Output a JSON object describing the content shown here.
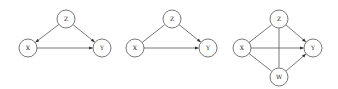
{
  "colors": {
    "stroke": "#555555",
    "fill": "#ffffff",
    "text": "#222222"
  },
  "node_radius": 9,
  "diagrams": [
    {
      "id": "diagram-1",
      "nodes": [
        {
          "id": "Z",
          "label": "Z",
          "x": 66,
          "y": 19
        },
        {
          "id": "X",
          "label": "X",
          "x": 28,
          "y": 48
        },
        {
          "id": "Y",
          "label": "Y",
          "x": 102,
          "y": 48
        }
      ],
      "edges": [
        {
          "from": "Z",
          "to": "X",
          "directed": true
        },
        {
          "from": "Z",
          "to": "Y",
          "directed": true
        },
        {
          "from": "X",
          "to": "Y",
          "directed": true
        }
      ]
    },
    {
      "id": "diagram-2",
      "nodes": [
        {
          "id": "Z",
          "label": "Z",
          "x": 172,
          "y": 19
        },
        {
          "id": "X",
          "label": "X",
          "x": 135,
          "y": 48
        },
        {
          "id": "Y",
          "label": "Y",
          "x": 208,
          "y": 48
        }
      ],
      "edges": [
        {
          "from": "X",
          "to": "Z",
          "directed": false
        },
        {
          "from": "Z",
          "to": "Y",
          "directed": true
        },
        {
          "from": "X",
          "to": "Y",
          "directed": true
        }
      ]
    },
    {
      "id": "diagram-3",
      "nodes": [
        {
          "id": "Z",
          "label": "Z",
          "x": 279,
          "y": 19
        },
        {
          "id": "X",
          "label": "X",
          "x": 242,
          "y": 48
        },
        {
          "id": "Y",
          "label": "Y",
          "x": 313,
          "y": 48
        },
        {
          "id": "W",
          "label": "W",
          "x": 279,
          "y": 77
        }
      ],
      "edges": [
        {
          "from": "X",
          "to": "Z",
          "directed": false
        },
        {
          "from": "X",
          "to": "W",
          "directed": false
        },
        {
          "from": "Z",
          "to": "W",
          "directed": false
        },
        {
          "from": "Z",
          "to": "Y",
          "directed": true
        },
        {
          "from": "X",
          "to": "Y",
          "directed": true
        },
        {
          "from": "W",
          "to": "Y",
          "directed": true
        }
      ]
    }
  ]
}
